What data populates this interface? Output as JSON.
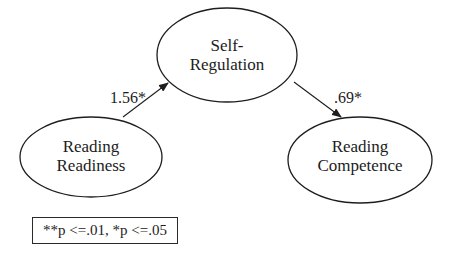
{
  "diagram": {
    "type": "path-model",
    "nodes": [
      {
        "id": "self-regulation",
        "line1": "Self-",
        "line2": "Regulation"
      },
      {
        "id": "reading-readiness",
        "line1": "Reading",
        "line2": "Readiness"
      },
      {
        "id": "reading-competence",
        "line1": "Reading",
        "line2": "Competence"
      }
    ],
    "edges": [
      {
        "from": "reading-readiness",
        "to": "self-regulation",
        "label": "1.56*"
      },
      {
        "from": "self-regulation",
        "to": "reading-competence",
        "label": ".69*"
      }
    ],
    "legend": {
      "text": "**p <=.01, *p <=.05"
    },
    "colors": {
      "stroke": "#1e1e1e",
      "background": "#ffffff",
      "text": "#1c1c1c"
    }
  }
}
